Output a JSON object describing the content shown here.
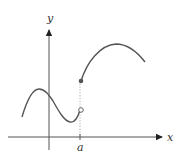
{
  "diagram": {
    "type": "function-graph",
    "axes": {
      "x_label": "x",
      "y_label": "y"
    },
    "ticks": [
      {
        "label": "a"
      }
    ],
    "points": [
      {
        "name": "filled-point",
        "kind": "closed",
        "position": "upper piece at x = a"
      },
      {
        "name": "open-point",
        "kind": "open",
        "position": "lower piece limit at x = a"
      }
    ],
    "colors": {
      "curve": "#555555",
      "axis": "#333333",
      "guide": "#999999"
    }
  }
}
